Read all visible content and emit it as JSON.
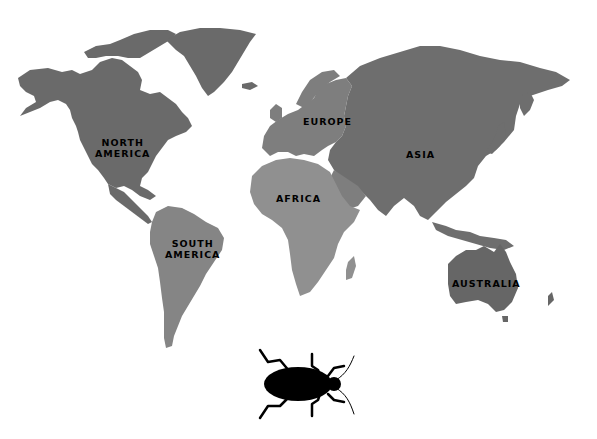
{
  "map": {
    "background": "#ffffff",
    "colors": {
      "north_america": "#6a6a6a",
      "south_america": "#858585",
      "europe": "#7e7e7e",
      "asia": "#6e6e6e",
      "africa": "#909090",
      "australia": "#666666",
      "greenland": "#6a6a6a"
    },
    "labels": {
      "north_america": [
        "NORTH",
        "AMERICA"
      ],
      "south_america": [
        "SOUTH",
        "AMERICA"
      ],
      "europe": "EUROPE",
      "asia": "ASIA",
      "africa": "AFRICA",
      "australia": "AUSTRALIA"
    }
  },
  "insect": {
    "icon": "beetle-icon",
    "color": "#000000"
  }
}
